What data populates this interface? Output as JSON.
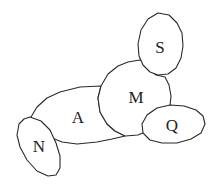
{
  "diagram": {
    "type": "region-adjacency",
    "regions": [
      {
        "id": "A",
        "label": "A"
      },
      {
        "id": "M",
        "label": "M"
      },
      {
        "id": "S",
        "label": "S"
      },
      {
        "id": "Q",
        "label": "Q"
      },
      {
        "id": "N",
        "label": "N"
      }
    ],
    "adjacencies": [
      [
        "A",
        "M"
      ],
      [
        "A",
        "N"
      ],
      [
        "M",
        "S"
      ],
      [
        "M",
        "Q"
      ],
      [
        "A",
        "Q"
      ]
    ],
    "colors": {
      "stroke": "#2a2a2a",
      "fill": "#ffffff",
      "text": "#222222"
    }
  }
}
